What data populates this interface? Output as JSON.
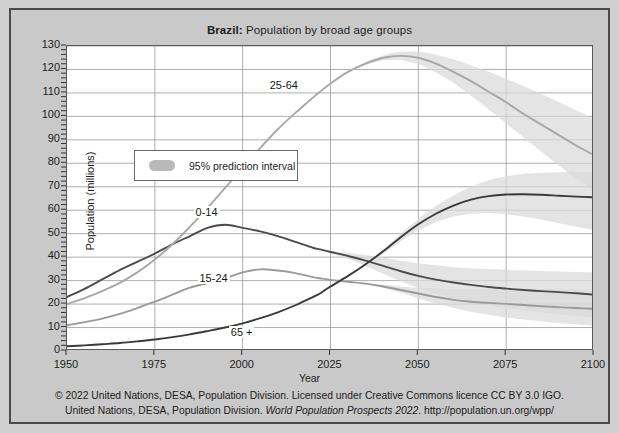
{
  "figure": {
    "title_bold": "Brazil:",
    "title_rest": " Population by broad age groups",
    "background_color": "#c9c9c9",
    "plot_background_color": "#ffffff",
    "border_color": "#4a4a4a"
  },
  "legend": {
    "label": "95% prediction interval",
    "swatch_color": "#b9b9b9",
    "position": "inside-top-left"
  },
  "footer": {
    "line1": "© 2022 United Nations, DESA, Population Division. Licensed under Creative Commons licence CC BY 3.0 IGO.",
    "line2_a": "United Nations, DESA, Population Division. ",
    "line2_italic": "World Population Prospects 2022",
    "line2_b": ". http://population.un.org/wpp/"
  },
  "chart_data": {
    "type": "line",
    "title": "Brazil: Population by broad age groups",
    "xlabel": "Year",
    "ylabel": "Population (millions)",
    "xlim": [
      1950,
      2100
    ],
    "ylim": [
      0,
      130
    ],
    "xticks": [
      1950,
      1975,
      2000,
      2025,
      2050,
      2075,
      2100
    ],
    "yticks": [
      0,
      10,
      20,
      30,
      40,
      50,
      60,
      70,
      80,
      90,
      100,
      110,
      120,
      130
    ],
    "grid": true,
    "legend_position": "upper left",
    "projection_start_year": 2022,
    "x": [
      1950,
      1955,
      1960,
      1965,
      1970,
      1975,
      1980,
      1985,
      1990,
      1995,
      2000,
      2005,
      2010,
      2015,
      2020,
      2022,
      2025,
      2030,
      2035,
      2040,
      2045,
      2050,
      2055,
      2060,
      2065,
      2070,
      2075,
      2080,
      2085,
      2090,
      2095,
      2100
    ],
    "series": [
      {
        "name": "0-14",
        "color": "#4c4c4c",
        "label_x": 1990,
        "label_y": 58,
        "values": [
          23.0,
          26.5,
          30.5,
          34.5,
          38.0,
          41.5,
          45.5,
          49.0,
          52.5,
          53.8,
          52.5,
          51.0,
          49.0,
          46.5,
          44.0,
          43.3,
          42.2,
          40.5,
          38.5,
          36.3,
          34.0,
          32.0,
          30.4,
          29.2,
          28.2,
          27.3,
          26.6,
          26.0,
          25.5,
          25.1,
          24.6,
          24.0
        ],
        "interval_lower": [
          null,
          null,
          null,
          null,
          null,
          null,
          null,
          null,
          null,
          null,
          null,
          null,
          null,
          null,
          null,
          43.3,
          41.8,
          39.3,
          36.2,
          32.9,
          29.7,
          26.8,
          24.4,
          22.4,
          20.8,
          19.4,
          18.3,
          17.3,
          16.4,
          15.6,
          14.9,
          14.2
        ],
        "interval_upper": [
          null,
          null,
          null,
          null,
          null,
          null,
          null,
          null,
          null,
          null,
          null,
          null,
          null,
          null,
          null,
          43.3,
          42.6,
          41.8,
          40.9,
          39.8,
          38.5,
          37.4,
          36.5,
          35.8,
          35.3,
          34.9,
          34.6,
          34.3,
          34.1,
          33.9,
          33.7,
          33.5
        ]
      },
      {
        "name": "15-24",
        "color": "#9a9a9a",
        "label_x": 1992,
        "label_y": 30,
        "values": [
          11.0,
          12.3,
          13.8,
          15.8,
          18.3,
          21.0,
          24.0,
          27.0,
          29.0,
          31.0,
          33.5,
          34.8,
          34.3,
          33.2,
          31.5,
          31.0,
          30.3,
          29.5,
          28.7,
          27.5,
          26.0,
          24.5,
          23.0,
          21.8,
          21.0,
          20.5,
          20.1,
          19.6,
          19.1,
          18.7,
          18.3,
          18.0
        ],
        "interval_lower": [
          null,
          null,
          null,
          null,
          null,
          null,
          null,
          null,
          null,
          null,
          null,
          null,
          null,
          null,
          null,
          31.0,
          30.3,
          29.5,
          28.6,
          27.0,
          24.8,
          22.4,
          20.2,
          18.3,
          16.7,
          15.4,
          14.3,
          13.4,
          12.6,
          11.9,
          11.3,
          10.8
        ],
        "interval_upper": [
          null,
          null,
          null,
          null,
          null,
          null,
          null,
          null,
          null,
          null,
          null,
          null,
          null,
          null,
          null,
          31.0,
          30.3,
          29.6,
          28.9,
          28.2,
          27.5,
          27.0,
          26.6,
          26.4,
          26.3,
          26.3,
          26.3,
          26.3,
          26.3,
          26.3,
          26.2,
          26.1
        ]
      },
      {
        "name": "25-64",
        "color": "#a8a8a8",
        "label_x": 2012,
        "label_y": 112,
        "values": [
          20.0,
          22.5,
          25.5,
          29.0,
          33.5,
          39.0,
          45.5,
          53.0,
          61.0,
          69.5,
          78.0,
          86.5,
          94.5,
          101.5,
          108.0,
          110.5,
          114.0,
          119.0,
          122.5,
          125.0,
          125.8,
          125.0,
          122.5,
          119.0,
          115.0,
          110.5,
          106.0,
          101.0,
          96.5,
          92.0,
          87.5,
          83.5
        ],
        "interval_lower": [
          null,
          null,
          null,
          null,
          null,
          null,
          null,
          null,
          null,
          null,
          null,
          null,
          null,
          null,
          null,
          110.5,
          114.0,
          118.8,
          122.0,
          124.0,
          124.0,
          122.3,
          118.8,
          114.3,
          108.8,
          103.0,
          97.0,
          91.0,
          85.0,
          79.0,
          73.5,
          68.5
        ],
        "interval_upper": [
          null,
          null,
          null,
          null,
          null,
          null,
          null,
          null,
          null,
          null,
          null,
          null,
          null,
          null,
          null,
          110.5,
          114.2,
          119.3,
          123.2,
          126.0,
          127.5,
          127.5,
          126.3,
          124.3,
          121.8,
          119.0,
          116.0,
          112.8,
          109.5,
          106.0,
          102.5,
          99.0
        ]
      },
      {
        "name": "65 +",
        "color": "#3a3a3a",
        "label_x": 2000,
        "label_y": 7,
        "values": [
          2.0,
          2.4,
          2.9,
          3.4,
          4.1,
          4.9,
          5.9,
          7.1,
          8.5,
          10.0,
          11.8,
          14.0,
          16.5,
          19.5,
          23.0,
          24.5,
          27.5,
          32.0,
          37.0,
          42.5,
          48.5,
          54.0,
          58.5,
          62.0,
          64.5,
          66.0,
          66.7,
          66.8,
          66.6,
          66.2,
          65.8,
          65.5
        ],
        "interval_lower": [
          null,
          null,
          null,
          null,
          null,
          null,
          null,
          null,
          null,
          null,
          null,
          null,
          null,
          null,
          null,
          24.5,
          27.4,
          31.8,
          36.5,
          41.5,
          46.8,
          51.5,
          55.0,
          57.3,
          58.5,
          58.8,
          58.3,
          57.3,
          56.0,
          54.5,
          53.0,
          51.5
        ],
        "interval_upper": [
          null,
          null,
          null,
          null,
          null,
          null,
          null,
          null,
          null,
          null,
          null,
          null,
          null,
          null,
          null,
          24.5,
          27.6,
          32.2,
          37.5,
          43.3,
          50.0,
          56.3,
          61.8,
          66.3,
          70.0,
          72.8,
          74.5,
          75.5,
          76.0,
          76.2,
          76.3,
          76.3
        ]
      }
    ]
  },
  "axes": {
    "ytick_labels": [
      "130",
      "120",
      "110",
      "100",
      "90",
      "80",
      "70",
      "60",
      "50",
      "40",
      "30",
      "20",
      "10",
      "0"
    ],
    "xtick_labels": [
      "1950",
      "1975",
      "2000",
      "2025",
      "2050",
      "2075",
      "2100"
    ],
    "xtitle": "Year",
    "ytitle": "Population (millions)"
  }
}
